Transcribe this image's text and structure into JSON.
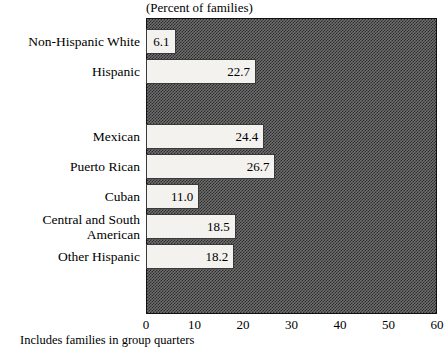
{
  "chart_data": {
    "type": "bar",
    "orientation": "horizontal",
    "title": "(Percent of families)",
    "xlabel": "",
    "ylabel": "",
    "xlim": [
      0,
      60
    ],
    "xticks": [
      0,
      10,
      20,
      30,
      40,
      50,
      60
    ],
    "grid": false,
    "legend": null,
    "footnote": "Includes families in group quarters",
    "categories": [
      "Non-Hispanic White",
      "Hispanic",
      "Mexican",
      "Puerto Rican",
      "Cuban",
      "Central and South\nAmerican",
      "Other Hispanic"
    ],
    "values": [
      6.1,
      22.7,
      24.4,
      26.7,
      11.0,
      18.5,
      18.2
    ],
    "value_labels": [
      "6.1",
      "22.7",
      "24.4",
      "26.7",
      "11.0",
      "18.5",
      "18.2"
    ],
    "group_break_after_index": 1
  },
  "colors": {
    "plot_background": "#6f6f6f",
    "plot_pattern": "#2b2b2b",
    "bar_fill": "#f4f2ee",
    "bar_border": "#3a3a3a",
    "text": "#000000",
    "page_background": "#ffffff"
  }
}
